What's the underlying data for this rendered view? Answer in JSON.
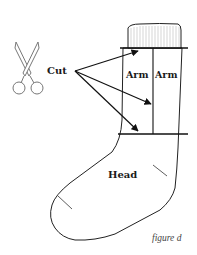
{
  "figure": {
    "caption": "figure d",
    "labels": {
      "cut": "Cut",
      "arm_left": "Arm",
      "arm_right": "Arm",
      "head": "Head"
    },
    "icons": {
      "scissors": "scissors-icon"
    },
    "colors": {
      "stroke": "#222222",
      "fill": "#ffffff",
      "rib": "#bbbbbb"
    }
  }
}
